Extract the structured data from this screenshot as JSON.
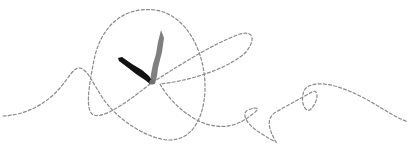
{
  "illustration": {
    "subject": "clock-hands-with-dashed-scribble",
    "colors": {
      "background": "#ffffff",
      "dashed_line": "#8a8a8a",
      "minute_hand": "#7f7f7f",
      "hour_hand": "#111111"
    },
    "clock_center": [
      152,
      82
    ],
    "hands": [
      {
        "name": "minute-hand",
        "tip": [
          161,
          30
        ]
      },
      {
        "name": "hour-hand",
        "tip": [
          119,
          58
        ]
      }
    ]
  }
}
